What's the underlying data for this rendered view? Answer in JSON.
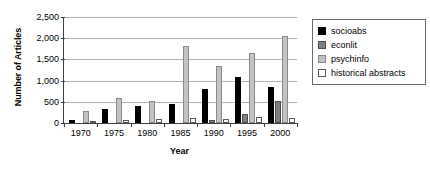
{
  "chart_data": {
    "type": "bar",
    "title": "",
    "xlabel": "Year",
    "ylabel": "Number of Articles",
    "categories": [
      "1970",
      "1975",
      "1980",
      "1985",
      "1990",
      "1995",
      "2000"
    ],
    "series": [
      {
        "name": "socioabs",
        "color": "#000000",
        "values": [
          80,
          340,
          390,
          460,
          800,
          1080,
          850
        ]
      },
      {
        "name": "econlit",
        "color": "#7f7f7f",
        "values": [
          0,
          0,
          0,
          0,
          70,
          210,
          530
        ]
      },
      {
        "name": "psychinfo",
        "color": "#c3c3c3",
        "values": [
          290,
          590,
          520,
          1820,
          1350,
          1640,
          2050
        ]
      },
      {
        "name": "historical abstracts",
        "color": "#ffffff",
        "values": [
          40,
          70,
          100,
          110,
          90,
          150,
          130
        ]
      }
    ],
    "ylim": [
      0,
      2500
    ],
    "ytick_values": [
      0,
      500,
      1000,
      1500,
      2000,
      2500
    ],
    "ytick_labels": [
      "0",
      "500",
      "1,000",
      "1,500",
      "2,000",
      "2,500"
    ],
    "grid": true,
    "legend_position": "right"
  }
}
